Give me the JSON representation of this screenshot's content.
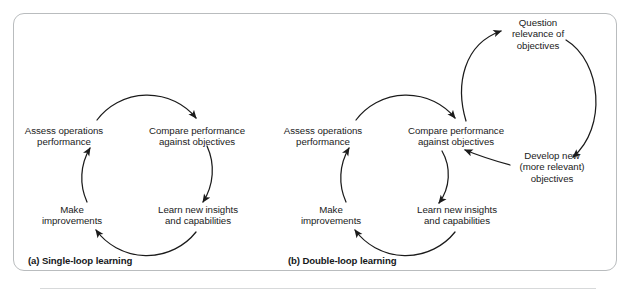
{
  "figure": {
    "background_color": "#ffffff",
    "frame_border_color": "#b9bcbe",
    "stroke_color": "#1b1b1b",
    "text_color": "#1b1b1b"
  },
  "panels": [
    {
      "id": "single-loop",
      "caption": "(a) Single-loop learning",
      "nodes": [
        {
          "id": "assess",
          "lines": [
            "Assess operations",
            "performance"
          ]
        },
        {
          "id": "compare",
          "lines": [
            "Compare performance",
            "against objectives"
          ]
        },
        {
          "id": "learn",
          "lines": [
            "Learn new insights",
            "and capabilities"
          ]
        },
        {
          "id": "improve",
          "lines": [
            "Make",
            "improvements"
          ]
        }
      ],
      "edges": [
        {
          "from": "assess",
          "to": "compare"
        },
        {
          "from": "compare",
          "to": "learn"
        },
        {
          "from": "learn",
          "to": "improve"
        },
        {
          "from": "improve",
          "to": "assess"
        }
      ]
    },
    {
      "id": "double-loop",
      "caption": "(b) Double-loop learning",
      "nodes": [
        {
          "id": "assess",
          "lines": [
            "Assess operations",
            "performance"
          ]
        },
        {
          "id": "compare",
          "lines": [
            "Compare performance",
            "against objectives"
          ]
        },
        {
          "id": "learn",
          "lines": [
            "Learn new insights",
            "and capabilities"
          ]
        },
        {
          "id": "improve",
          "lines": [
            "Make",
            "improvements"
          ]
        },
        {
          "id": "question",
          "lines": [
            "Question",
            "relevance of",
            "objectives"
          ]
        },
        {
          "id": "develop",
          "lines": [
            "Develop new",
            "(more relevant)",
            "objectives"
          ]
        }
      ],
      "edges": [
        {
          "from": "assess",
          "to": "compare"
        },
        {
          "from": "compare",
          "to": "learn"
        },
        {
          "from": "learn",
          "to": "improve"
        },
        {
          "from": "improve",
          "to": "assess"
        },
        {
          "from": "compare",
          "to": "question"
        },
        {
          "from": "question",
          "to": "develop"
        },
        {
          "from": "develop",
          "to": "compare"
        }
      ]
    }
  ]
}
